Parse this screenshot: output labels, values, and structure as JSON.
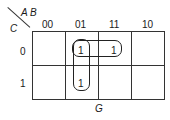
{
  "kmap": {
    "corner": {
      "row_var": "C",
      "col_vars": "A B"
    },
    "col_headers": [
      "00",
      "01",
      "11",
      "10"
    ],
    "row_headers": [
      "0",
      "1"
    ],
    "cells": [
      [
        "",
        "1",
        "1",
        ""
      ],
      [
        "",
        "1",
        "",
        ""
      ]
    ],
    "groups": [
      {
        "name": "row0-cols-01-11",
        "cells": [
          [
            0,
            1
          ],
          [
            0,
            2
          ]
        ]
      },
      {
        "name": "col01-rows-0-1",
        "cells": [
          [
            0,
            1
          ],
          [
            1,
            1
          ]
        ]
      }
    ],
    "output_label": "G"
  }
}
